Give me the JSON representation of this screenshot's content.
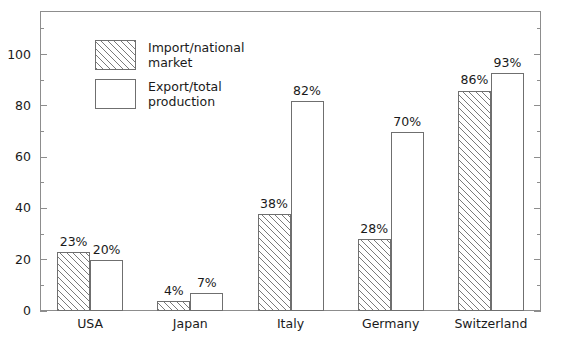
{
  "chart_data": {
    "type": "bar",
    "title": "",
    "subtitle": "",
    "xlabel": "",
    "ylabel": "",
    "ylim": [
      0,
      117
    ],
    "grid": false,
    "legend_position": "inside-top-left",
    "y_major_ticks": [
      0,
      20,
      40,
      60,
      80,
      100
    ],
    "y_minor_ticks": [
      10,
      30,
      50,
      70,
      90,
      110
    ],
    "y_tick_labels": [
      "0",
      "20",
      "40",
      "60",
      "80",
      "100"
    ],
    "categories": [
      "USA",
      "Japan",
      "Italy",
      "Germany",
      "Switzerland"
    ],
    "series": [
      {
        "name": "Import/national market",
        "style": "hatched",
        "values": [
          23,
          4,
          38,
          28,
          86
        ],
        "data_labels": [
          "23%",
          "4%",
          "38%",
          "28%",
          "86%"
        ]
      },
      {
        "name": "Export/total production",
        "style": "open",
        "values": [
          20,
          7,
          82,
          70,
          93
        ],
        "data_labels": [
          "20%",
          "7%",
          "82%",
          "70%",
          "93%"
        ]
      }
    ]
  },
  "legend": {
    "items": [
      {
        "label": "Import/national\nmarket",
        "style": "hatched"
      },
      {
        "label": "Export/total\nproduction",
        "style": "open"
      }
    ]
  },
  "colors": {
    "frame": "#8d8d8d",
    "bar_outline": "#6f6f6f",
    "hatch": "#7a7a7a",
    "text": "#1a1a1a",
    "background": "#ffffff"
  }
}
